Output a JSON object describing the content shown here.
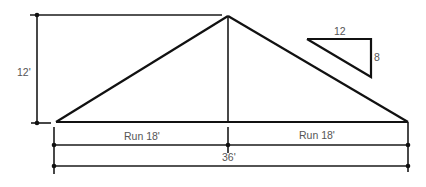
{
  "diagram": {
    "type": "roof-truss-dimension-drawing",
    "colors": {
      "line": "#111111",
      "label": "#555555",
      "background": "#ffffff"
    },
    "labels": {
      "rise": "12'",
      "left_run": "Run 18'",
      "right_run": "Run 18'",
      "span": "36'",
      "pitch_run": "12",
      "pitch_rise": "8"
    },
    "dimensions": {
      "rise_ft": 12,
      "run_ft": 18,
      "span_ft": 36,
      "pitch": {
        "rise": 8,
        "run": 12
      }
    }
  }
}
